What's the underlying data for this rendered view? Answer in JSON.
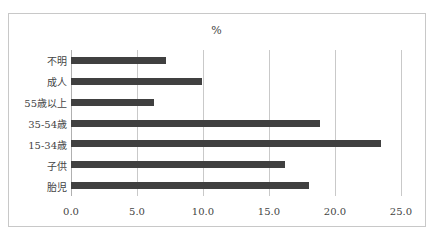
{
  "chart_data": {
    "type": "bar",
    "orientation": "horizontal",
    "title": "%",
    "xlabel": "",
    "ylabel": "",
    "categories": [
      "不明",
      "成人",
      "55歳以上",
      "35-54歳",
      "15-34歳",
      "子供",
      "胎児"
    ],
    "values": [
      7.2,
      9.9,
      6.3,
      18.9,
      23.5,
      16.2,
      18.0
    ],
    "xlim": [
      0,
      25
    ],
    "xticks": [
      "0.0",
      "5.0",
      "10.0",
      "15.0",
      "20.0",
      "25.0"
    ],
    "grid": "vertical",
    "legend": "none",
    "bar_color": "#404040"
  }
}
